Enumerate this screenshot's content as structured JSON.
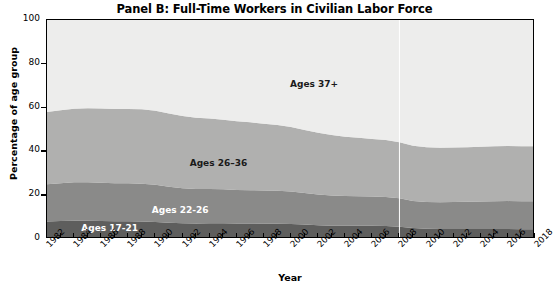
{
  "chart_data": {
    "type": "area",
    "title": "Panel B: Full-Time Workers in Civilian Labor Force",
    "xlabel": "Year",
    "ylabel": "Percentage of age group",
    "xlim": [
      1982,
      2018
    ],
    "ylim": [
      0,
      100
    ],
    "yticks": [
      0,
      20,
      40,
      60,
      80,
      100
    ],
    "xticks": [
      1982,
      1984,
      1986,
      1988,
      1990,
      1992,
      1994,
      1996,
      1998,
      2000,
      2002,
      2004,
      2006,
      2008,
      2010,
      2012,
      2014,
      2016,
      2018
    ],
    "grid": false,
    "legend_position": "inline-annotations",
    "stacked": true,
    "x": [
      1982,
      1983,
      1984,
      1985,
      1986,
      1987,
      1988,
      1989,
      1990,
      1991,
      1992,
      1993,
      1994,
      1995,
      1996,
      1997,
      1998,
      1999,
      2000,
      2001,
      2002,
      2003,
      2004,
      2005,
      2006,
      2007,
      2008,
      2009,
      2010,
      2011,
      2012,
      2013,
      2014,
      2015,
      2016,
      2017,
      2018
    ],
    "series": [
      {
        "name": "Ages 17-21",
        "color": "#5e5e5d",
        "label_position": {
          "x": 1984.6,
          "y": 4.0
        },
        "label_color": "light",
        "values": [
          8.0,
          8.2,
          8.3,
          8.3,
          8.2,
          8.1,
          8.1,
          8.0,
          7.8,
          7.4,
          7.2,
          7.1,
          7.2,
          7.2,
          7.1,
          7.1,
          7.0,
          7.0,
          6.9,
          6.6,
          6.3,
          6.1,
          6.0,
          6.0,
          6.0,
          5.9,
          5.6,
          5.0,
          4.7,
          4.6,
          4.6,
          4.6,
          4.6,
          4.6,
          4.6,
          4.5,
          4.5
        ]
      },
      {
        "name": "Ages 22-26",
        "color": "#8a8a89",
        "label_position": {
          "x": 1989.8,
          "y": 12.5
        },
        "label_color": "light",
        "values": [
          17.0,
          17.3,
          17.6,
          17.6,
          17.5,
          17.4,
          17.3,
          17.2,
          17.0,
          16.5,
          16.0,
          15.7,
          15.6,
          15.5,
          15.3,
          15.2,
          15.1,
          15.0,
          14.8,
          14.4,
          14.0,
          13.8,
          13.6,
          13.5,
          13.4,
          13.3,
          13.0,
          12.4,
          12.2,
          12.2,
          12.3,
          12.4,
          12.5,
          12.6,
          12.7,
          12.7,
          12.7
        ]
      },
      {
        "name": "Ages 26–36",
        "color": "#b0b0af",
        "label_position": {
          "x": 1992.6,
          "y": 34.0
        },
        "label_color": "dark",
        "values": [
          33.0,
          33.3,
          33.6,
          33.8,
          33.9,
          33.9,
          34.0,
          34.0,
          33.8,
          33.4,
          33.0,
          32.6,
          32.2,
          31.8,
          31.4,
          31.0,
          30.5,
          30.0,
          29.4,
          28.8,
          28.2,
          27.6,
          27.1,
          26.7,
          26.3,
          26.0,
          25.6,
          25.2,
          25.0,
          24.9,
          24.9,
          24.9,
          25.0,
          25.1,
          25.2,
          25.2,
          25.2
        ]
      },
      {
        "name": "Ages 37+",
        "color": "#ededec",
        "label_position": {
          "x": 2000.0,
          "y": 70.0
        },
        "label_color": "dark",
        "values": [
          42.0,
          41.2,
          40.5,
          40.3,
          40.4,
          40.6,
          40.6,
          40.8,
          41.4,
          42.7,
          43.8,
          44.6,
          45.0,
          45.5,
          46.2,
          46.7,
          47.4,
          48.0,
          48.9,
          50.2,
          51.5,
          52.5,
          53.3,
          53.8,
          54.3,
          54.8,
          55.8,
          57.4,
          58.1,
          58.3,
          58.2,
          58.1,
          57.9,
          57.7,
          57.5,
          57.6,
          57.6
        ]
      }
    ],
    "annotations": [
      {
        "type": "vline",
        "x": 2008,
        "color": "#ffffff"
      }
    ]
  }
}
